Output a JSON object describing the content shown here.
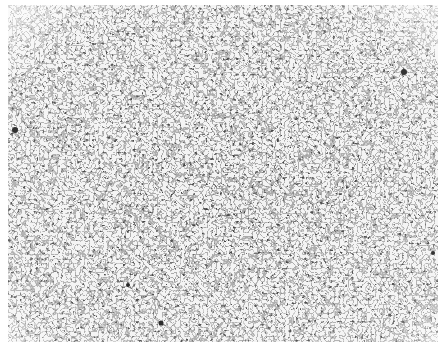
{
  "image": {
    "subject": "grayscale micrograph of polycrystalline grain structure",
    "colors": {
      "background": "#ffffff",
      "grain": "#f2f2f2",
      "boundary": "#1a1a1a"
    }
  }
}
